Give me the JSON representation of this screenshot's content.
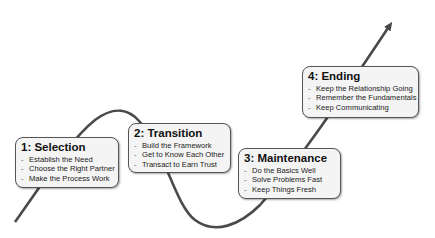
{
  "diagram": {
    "colors": {
      "curve": "#4a4a4a",
      "box_bg": "#f4f4f4",
      "box_border": "#555555"
    },
    "stages": [
      {
        "title": "1: Selection",
        "items": [
          "Establish the Need",
          "Choose the Right Partner",
          "Make the Process Work"
        ]
      },
      {
        "title": "2: Transition",
        "items": [
          "Build the Framework",
          "Get to Know Each Other",
          "Transact to Earn Trust"
        ]
      },
      {
        "title": "3: Maintenance",
        "items": [
          "Do the Basics Well",
          "Solve Problems Fast",
          "Keep Things Fresh"
        ]
      },
      {
        "title": "4: Ending",
        "items": [
          "Keep the Relationship Going",
          "Remember the Fundamentals",
          "Keep Communicating"
        ]
      }
    ],
    "bullet": "-"
  }
}
